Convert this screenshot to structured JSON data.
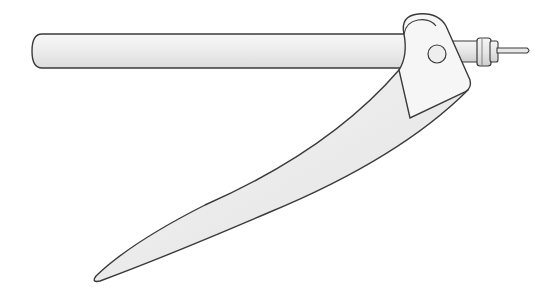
{
  "illustration": {
    "subject": "drafting compass arm with pivot hinge and pen nib",
    "colors": {
      "background": "#ffffff",
      "outline": "#3a3a3a",
      "rod_fill": "#ededed",
      "rod_highlight": "#fafafa",
      "blade_fill": "#e6e6e6",
      "blade_light": "#f3f3f3",
      "hinge_fill": "#f6f6f6",
      "nib_fill": "#e4e4e4"
    },
    "parts": [
      {
        "name": "rod",
        "description": "horizontal cylindrical rod"
      },
      {
        "name": "hinge-head",
        "description": "rounded pivot head"
      },
      {
        "name": "pivot-pin",
        "description": "circular pivot pin"
      },
      {
        "name": "blade",
        "description": "long tapered leg"
      },
      {
        "name": "nib-collar",
        "description": "ribbed collar"
      },
      {
        "name": "needle",
        "description": "thin needle tip"
      }
    ]
  }
}
